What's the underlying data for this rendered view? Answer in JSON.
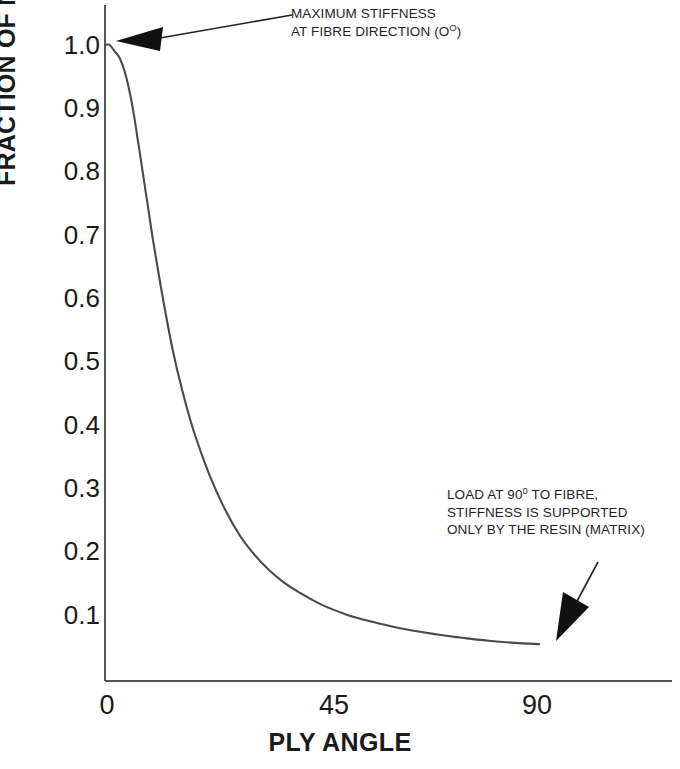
{
  "chart_data": {
    "type": "line",
    "title": "",
    "xlabel": "PLY ANGLE",
    "ylabel": "FRACTION OF MAXIMUM STIFFNESS",
    "xlim": [
      0,
      100
    ],
    "ylim": [
      0,
      1.05
    ],
    "grid": false,
    "legend": null,
    "xticks": [
      {
        "value": 0,
        "label": "0"
      },
      {
        "value": 45,
        "label": "45"
      },
      {
        "value": 90,
        "label": "90"
      }
    ],
    "yticks": [
      {
        "value": 1.0,
        "label": "1.0"
      },
      {
        "value": 0.9,
        "label": "0.9"
      },
      {
        "value": 0.8,
        "label": "0.8"
      },
      {
        "value": 0.7,
        "label": "0.7"
      },
      {
        "value": 0.6,
        "label": "0.6"
      },
      {
        "value": 0.5,
        "label": "0.5"
      },
      {
        "value": 0.4,
        "label": "0.4"
      },
      {
        "value": 0.3,
        "label": "0.3"
      },
      {
        "value": 0.2,
        "label": "0.2"
      },
      {
        "value": 0.1,
        "label": "0.1"
      }
    ],
    "series": [
      {
        "name": "stiffness fraction vs ply angle",
        "x": [
          0,
          1,
          2,
          3,
          4,
          5,
          6,
          7,
          8,
          9,
          10,
          12,
          14,
          16,
          18,
          20,
          22,
          25,
          28,
          31,
          34,
          37,
          40,
          45,
          50,
          55,
          60,
          65,
          70,
          75,
          80,
          85,
          90
        ],
        "y": [
          1.0,
          1.0,
          0.99,
          0.98,
          0.96,
          0.93,
          0.89,
          0.84,
          0.79,
          0.74,
          0.69,
          0.6,
          0.52,
          0.455,
          0.4,
          0.355,
          0.315,
          0.265,
          0.225,
          0.195,
          0.171,
          0.152,
          0.137,
          0.116,
          0.101,
          0.09,
          0.081,
          0.074,
          0.068,
          0.063,
          0.059,
          0.056,
          0.054
        ]
      }
    ],
    "annotations": [
      {
        "id": "max-stiffness",
        "lines": [
          "MAXIMUM STIFFNESS",
          "AT FIBRE DIRECTION (O",
          "°",
          ")"
        ],
        "line1": "MAXIMUM STIFFNESS",
        "line2_pre": "AT FIBRE DIRECTION (O",
        "line2_sup": "O",
        "line2_post": ")",
        "points_to": {
          "x": 0,
          "y": 1.0
        }
      },
      {
        "id": "resin-matrix",
        "line1_pre": "LOAD AT 90",
        "line1_sup": "0",
        "line1_post": " TO FIBRE,",
        "line2": "STIFFNESS IS SUPPORTED",
        "line3": "ONLY BY THE RESIN (MATRIX)",
        "points_to": {
          "x": 90,
          "y": 0.05
        }
      }
    ],
    "colors": {
      "curve": "#4a4a4a",
      "axis": "#555555",
      "text": "#1a1a1a",
      "arrow": "#111111",
      "background": "#ffffff"
    }
  }
}
